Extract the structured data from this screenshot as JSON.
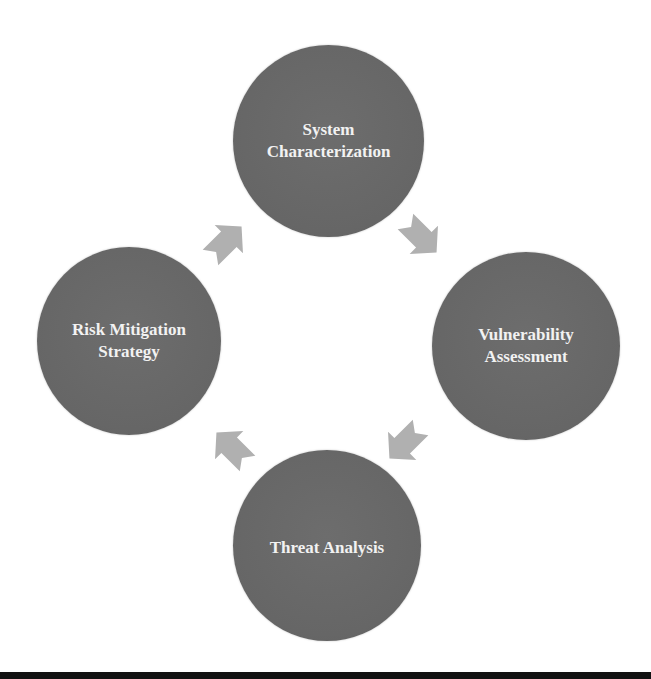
{
  "diagram": {
    "type": "cycle",
    "direction": "clockwise",
    "colors": {
      "node_fill": "#666666",
      "node_text": "#f2f2f2",
      "arrow_fill": "#b0b0b0",
      "background": "#ffffff",
      "bottom_bar": "#111111"
    },
    "nodes": [
      {
        "id": "top",
        "label": "System\nCharacterization"
      },
      {
        "id": "right",
        "label": "Vulnerability\nAssessment"
      },
      {
        "id": "bottom",
        "label": "Threat Analysis"
      },
      {
        "id": "left",
        "label": "Risk Mitigation\nStrategy"
      }
    ],
    "arrows": [
      {
        "from": "System Characterization",
        "to": "Vulnerability Assessment",
        "icon": "arrow-down-right-icon"
      },
      {
        "from": "Vulnerability Assessment",
        "to": "Threat Analysis",
        "icon": "arrow-down-left-icon"
      },
      {
        "from": "Threat Analysis",
        "to": "Risk Mitigation Strategy",
        "icon": "arrow-up-left-icon"
      },
      {
        "from": "Risk Mitigation Strategy",
        "to": "System Characterization",
        "icon": "arrow-up-right-icon"
      }
    ]
  }
}
